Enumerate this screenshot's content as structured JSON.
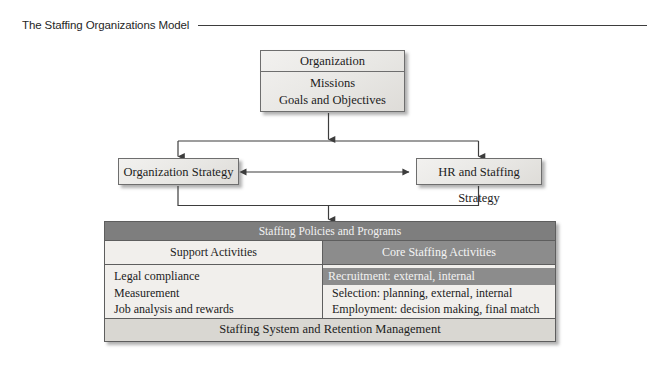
{
  "figure": {
    "title": "The Staffing Organizations Model"
  },
  "organization": {
    "title": "Organization",
    "lines": [
      "Missions",
      "Goals and Objectives"
    ]
  },
  "strategies": {
    "left": "Organization Strategy",
    "right": "HR and Staffing Strategy"
  },
  "staffing_table": {
    "header": "Staffing Policies and Programs",
    "columns": [
      {
        "name": "support",
        "header": "Support Activities",
        "items": [
          {
            "text": "Legal compliance",
            "highlighted": false
          },
          {
            "text": "Measurement",
            "highlighted": false
          },
          {
            "text": "Job analysis and rewards",
            "highlighted": false
          }
        ]
      },
      {
        "name": "core",
        "header": "Core Staffing Activities",
        "items": [
          {
            "text": "Recruitment: external, internal",
            "highlighted": true
          },
          {
            "text": "Selection: planning, external, internal",
            "highlighted": false
          },
          {
            "text": "Employment: decision making, final match",
            "highlighted": false
          }
        ]
      }
    ],
    "footer": "Staffing System and Retention Management"
  },
  "colors": {
    "header_band": "#7e7e7e",
    "core_band": "#8c8c8c",
    "light_panel": "#f1efec",
    "footer_band": "#d9d7d2",
    "box_border": "#6e6e6e",
    "connector": "#3d3d3d",
    "rule": "#3d3d3d"
  },
  "connectors": {
    "org_to_bus": "arrow-down",
    "bus_to_org_strategy": "arrow-down",
    "bus_to_hr_strategy": "arrow-down",
    "strategy_bidirectional": "arrow-left-right",
    "strategies_to_table": "arrow-down"
  }
}
